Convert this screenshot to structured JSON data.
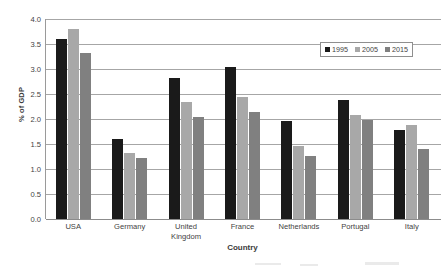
{
  "chart_data": {
    "type": "bar",
    "title": "",
    "xlabel": "Country",
    "ylabel": "% of GDP",
    "categories": [
      "USA",
      "Germany",
      "United Kingdom",
      "France",
      "Netherlands",
      "Portugal",
      "Italy"
    ],
    "category_lines": [
      [
        "USA"
      ],
      [
        "Germany"
      ],
      [
        "United",
        "Kingdom"
      ],
      [
        "France"
      ],
      [
        "Netherlands"
      ],
      [
        "Portugal"
      ],
      [
        "Italy"
      ]
    ],
    "series": [
      {
        "name": "1995",
        "color": "#1a1a1a",
        "values": [
          3.6,
          1.61,
          2.83,
          3.05,
          1.96,
          2.38,
          1.78
        ]
      },
      {
        "name": "2005",
        "color": "#a8a8a8",
        "values": [
          3.81,
          1.33,
          2.34,
          2.44,
          1.47,
          2.08,
          1.88
        ]
      },
      {
        "name": "2015",
        "color": "#808080",
        "values": [
          3.32,
          1.23,
          2.04,
          2.14,
          1.27,
          1.98,
          1.4
        ]
      }
    ],
    "ylim": [
      0.0,
      4.0
    ],
    "ytick_step": 0.5,
    "ytick_labels": [
      "0.0",
      "0.5",
      "1.0",
      "1.5",
      "2.0",
      "2.5",
      "3.0",
      "3.5",
      "4.0"
    ],
    "grid": true,
    "legend_position": "top-right",
    "legend_entries": [
      "1995",
      "2005",
      "2015"
    ]
  }
}
